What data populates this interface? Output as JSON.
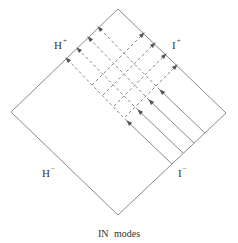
{
  "diagram": {
    "type": "penrose-diagram",
    "caption": "IN modes",
    "labels": {
      "h_plus": {
        "base": "H",
        "sup": "+"
      },
      "i_plus": {
        "base": "I",
        "sup": "+"
      },
      "h_minus": {
        "base": "H",
        "sup": "−"
      },
      "i_minus": {
        "base": "I",
        "sup": "−"
      }
    },
    "colors": {
      "line": "#8a8a8a",
      "text": "#333333"
    },
    "diamond": {
      "top": [
        118,
        9
      ],
      "right": [
        226,
        113
      ],
      "bottom": [
        118,
        215
      ],
      "left": [
        11,
        112
      ]
    },
    "in_modes": [
      {
        "start": [
          205,
          133
        ],
        "arrow": [
          160,
          90
        ],
        "horizon": [
          98,
          27
        ]
      },
      {
        "start": [
          194,
          143
        ],
        "arrow": [
          149,
          100
        ],
        "horizon": [
          88,
          37
        ]
      },
      {
        "start": [
          183,
          153
        ],
        "arrow": [
          138,
          110
        ],
        "horizon": [
          77,
          48
        ]
      },
      {
        "start": [
          172,
          164
        ],
        "arrow": [
          127,
          121
        ],
        "horizon": [
          66,
          58
        ]
      }
    ],
    "reflected_modes": [
      {
        "start": [
          92,
          85
        ],
        "end": [
          144,
          33
        ]
      },
      {
        "start": [
          103,
          95
        ],
        "end": [
          155,
          43
        ]
      },
      {
        "start": [
          114,
          106
        ],
        "end": [
          166,
          54
        ]
      },
      {
        "start": [
          125,
          117
        ],
        "end": [
          177,
          65
        ]
      }
    ]
  }
}
